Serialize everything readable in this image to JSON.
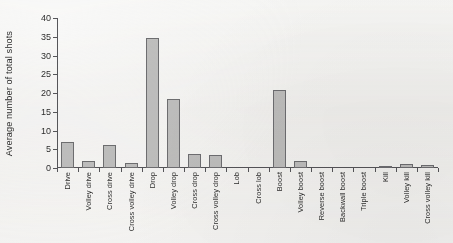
{
  "chart_data": {
    "type": "bar",
    "title": "",
    "xlabel": "",
    "ylabel": "Average number of total shots",
    "ylim": [
      0,
      40
    ],
    "yticks": [
      0,
      5,
      10,
      15,
      20,
      25,
      30,
      35,
      40
    ],
    "grid": false,
    "legend": null,
    "bar_color": "#c4c4c4",
    "bar_edge_color": "#6f6f73",
    "axis_color": "#56565a",
    "background": "#f2f1ef",
    "categories": [
      "Drive",
      "Volley drive",
      "Cross drive",
      "Cross volley drive",
      "Drop",
      "Volley drop",
      "Cross drop",
      "Cross volley drop",
      "Lob",
      "Cross lob",
      "Boost",
      "Volley boost",
      "Reverse boost",
      "Backwall boost",
      "Triple boost",
      "Kill",
      "Volley kill",
      "Cross volley kill"
    ],
    "values": [
      6.9,
      2.0,
      6.1,
      1.3,
      34.8,
      18.5,
      3.8,
      3.5,
      0,
      0,
      20.7,
      1.8,
      0,
      0,
      0,
      0.5,
      1.0,
      0.7
    ]
  }
}
